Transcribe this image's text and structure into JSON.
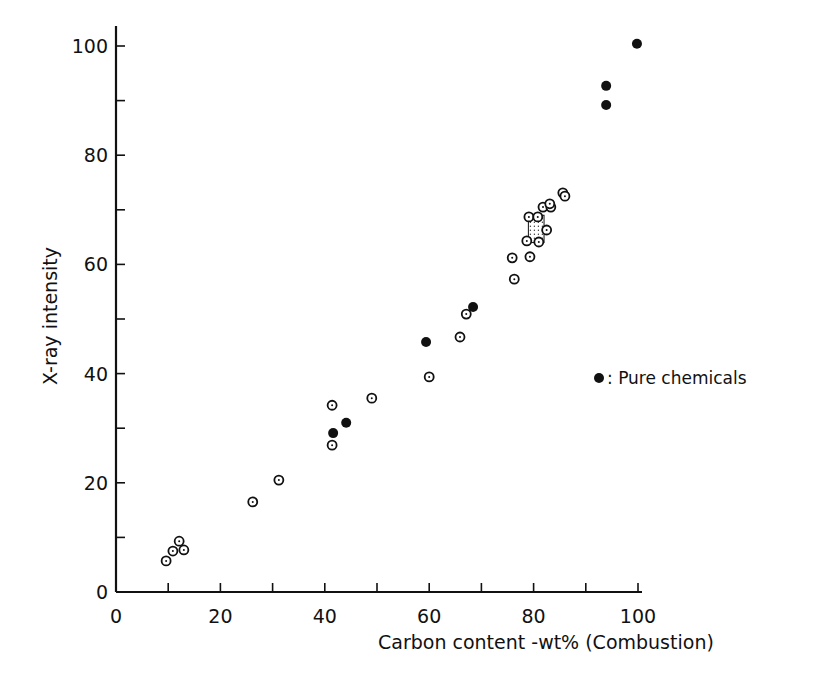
{
  "chart_data": {
    "type": "scatter",
    "title": "",
    "xlabel": "Carbon content -wt% (Combustion)",
    "ylabel": "X-ray intensity",
    "xlim": [
      0,
      100
    ],
    "ylim": [
      0,
      100
    ],
    "x_ticks": [
      0,
      20,
      40,
      60,
      80,
      100
    ],
    "x_tick_labels": [
      "0",
      "20",
      "40",
      "60",
      "80",
      "100"
    ],
    "x_minor_ticks": [
      10,
      30,
      50,
      70,
      90
    ],
    "y_ticks": [
      0,
      20,
      40,
      60,
      80,
      100
    ],
    "y_tick_labels": [
      "0",
      "20",
      "40",
      "60",
      "80",
      "100"
    ],
    "y_minor_ticks": [
      10,
      30,
      50,
      70,
      90
    ],
    "grid": false,
    "legend": {
      "position": "right-middle",
      "entries": [
        {
          "marker": "filled-circle",
          "label": ": Pure chemicals"
        }
      ]
    },
    "series": [
      {
        "name": "Samples",
        "marker": "open-circle-dot",
        "points": [
          [
            9.6,
            5.7
          ],
          [
            10.9,
            7.5
          ],
          [
            12.1,
            9.3
          ],
          [
            13.0,
            7.7
          ],
          [
            26.2,
            16.5
          ],
          [
            31.2,
            20.5
          ],
          [
            41.4,
            34.2
          ],
          [
            41.4,
            26.9
          ],
          [
            49.0,
            35.5
          ],
          [
            60.0,
            39.4
          ],
          [
            65.9,
            46.7
          ],
          [
            67.1,
            50.9
          ],
          [
            75.9,
            61.2
          ],
          [
            76.3,
            57.3
          ],
          [
            79.3,
            61.4
          ],
          [
            78.7,
            64.3
          ],
          [
            81.0,
            64.1
          ],
          [
            82.5,
            66.3
          ],
          [
            79.1,
            68.7
          ],
          [
            80.8,
            68.7
          ],
          [
            81.8,
            70.5
          ],
          [
            83.3,
            70.5
          ],
          [
            83.1,
            71.1
          ],
          [
            85.6,
            73.1
          ],
          [
            86.0,
            72.5
          ]
        ]
      },
      {
        "name": "Pure chemicals",
        "marker": "filled-circle",
        "points": [
          [
            41.6,
            29.1
          ],
          [
            44.1,
            31.0
          ],
          [
            59.4,
            45.8
          ],
          [
            68.4,
            52.2
          ],
          [
            93.9,
            89.2
          ],
          [
            93.9,
            92.7
          ],
          [
            99.8,
            100.4
          ]
        ]
      }
    ],
    "annotations": [
      {
        "type": "stippled-region",
        "description": "dotted cluster region",
        "x_range": [
          79,
          82
        ],
        "y_range": [
          64,
          69
        ]
      }
    ]
  }
}
